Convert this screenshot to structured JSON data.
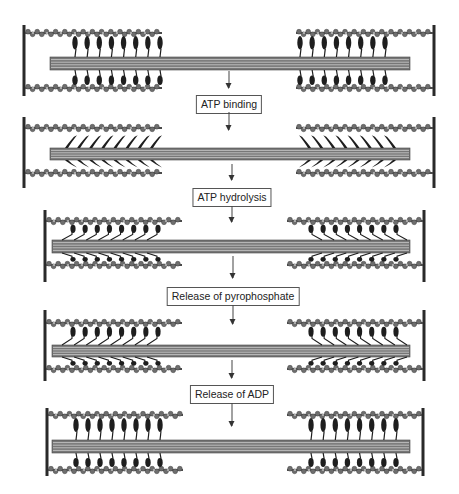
{
  "diagram": {
    "colors": {
      "zline": "#2a2a2a",
      "actin": "#6e6e6e",
      "actin_dark": "#4a4a4a",
      "thick": "#777777",
      "thick_line": "#cfcfcf",
      "head": "#1e1e1e",
      "box_border": "#555555",
      "text": "#222222"
    },
    "steps": [
      {
        "label": "ATP binding",
        "box_x": 229,
        "box_y": 95,
        "arrow_in": [
          71,
          88
        ],
        "arrow_out": [
          112,
          130
        ]
      },
      {
        "label": "ATP hydrolysis",
        "box_x": 232,
        "box_y": 188,
        "arrow_in": [
          164,
          180
        ],
        "arrow_out": [
          206,
          222
        ]
      },
      {
        "label": "Release of pyrophosphate",
        "box_x": 233,
        "box_y": 287,
        "arrow_in": [
          256,
          278
        ],
        "arrow_out": [
          305,
          324
        ]
      },
      {
        "label": "Release of ADP",
        "box_x": 232,
        "box_y": 385,
        "arrow_in": [
          360,
          378
        ],
        "arrow_out": [
          403,
          426
        ]
      }
    ],
    "panels": [
      {
        "id": "rigor",
        "state": "upright",
        "zl": 24,
        "zr": 434,
        "ztop": 25,
        "zbot": 96,
        "actin_top": 33,
        "actin_bot": 88,
        "thick_top": 57,
        "thick_bot": 70,
        "thick_l": 50,
        "thick_r": 410,
        "actin_len": 138,
        "heads_l": [
          75,
          160
        ],
        "heads_r": [
          300,
          385
        ],
        "head_count": 8
      },
      {
        "id": "atp-bound",
        "state": "detached",
        "zl": 24,
        "zr": 434,
        "ztop": 117,
        "zbot": 188,
        "actin_top": 128,
        "actin_bot": 173,
        "thick_top": 148,
        "thick_bot": 160,
        "thick_l": 50,
        "thick_r": 410,
        "actin_len": 138,
        "heads_l": [
          68,
          153
        ],
        "heads_r": [
          308,
          393
        ],
        "head_count": 8
      },
      {
        "id": "hydrolyzed",
        "state": "cocked",
        "zl": 45,
        "zr": 424,
        "ztop": 210,
        "zbot": 282,
        "actin_top": 221,
        "actin_bot": 265,
        "thick_top": 240,
        "thick_bot": 253,
        "thick_l": 52,
        "thick_r": 410,
        "actin_len": 137,
        "heads_l": [
          72,
          157
        ],
        "heads_r": [
          312,
          397
        ],
        "head_count": 8
      },
      {
        "id": "pi-released",
        "state": "cocked",
        "zl": 45,
        "zr": 424,
        "ztop": 310,
        "zbot": 381,
        "actin_top": 323,
        "actin_bot": 369,
        "thick_top": 345,
        "thick_bot": 357,
        "thick_l": 52,
        "thick_r": 410,
        "actin_len": 137,
        "heads_l": [
          72,
          157
        ],
        "heads_r": [
          312,
          397
        ],
        "head_count": 8
      },
      {
        "id": "adp-released",
        "state": "upright",
        "zl": 47,
        "zr": 423,
        "ztop": 408,
        "zbot": 476,
        "actin_top": 415,
        "actin_bot": 470,
        "thick_top": 440,
        "thick_bot": 453,
        "thick_l": 52,
        "thick_r": 410,
        "actin_len": 136,
        "heads_l": [
          76,
          160
        ],
        "heads_r": [
          311,
          396
        ],
        "head_count": 8
      }
    ]
  }
}
